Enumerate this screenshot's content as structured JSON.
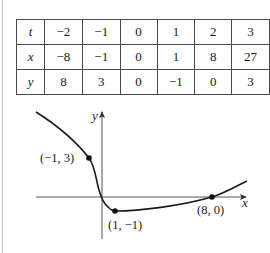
{
  "table": {
    "rows": [
      {
        "label": "t",
        "values": [
          "−2",
          "−1",
          "0",
          "1",
          "2",
          "3"
        ]
      },
      {
        "label": "x",
        "values": [
          "−8",
          "−1",
          "0",
          "1",
          "8",
          "27"
        ]
      },
      {
        "label": "y",
        "values": [
          "8",
          "3",
          "0",
          "−1",
          "0",
          "3"
        ]
      }
    ]
  },
  "graph": {
    "x_axis_label": "x",
    "y_axis_label": "y",
    "points": [
      {
        "label": "(−1, 3)",
        "x": -1,
        "y": 3
      },
      {
        "label": "(1, −1)",
        "x": 1,
        "y": -1
      },
      {
        "label": "(8, 0)",
        "x": 8,
        "y": 0
      }
    ],
    "colors": {
      "curve": "#1a1a1a",
      "axis": "#555555"
    }
  }
}
